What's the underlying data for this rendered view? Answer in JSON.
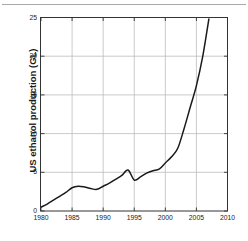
{
  "figure": {
    "name": "us-ethanol-production-chart",
    "background_color": "#ffffff",
    "frame_color": "#333333",
    "grid_color": "#bdbdbd",
    "line_color": "#1a1a1a",
    "top_rule_color": "#a8a8a8"
  },
  "chart_data": {
    "type": "line",
    "title": "",
    "subtitle": "",
    "xlabel": "",
    "ylabel": "US ethanol production (GL)",
    "xlim": [
      1980,
      2010
    ],
    "ylim": [
      0,
      25
    ],
    "xticks": [
      1980,
      1985,
      1990,
      1995,
      2000,
      2005,
      2010
    ],
    "xtick_labels": [
      "1980",
      "1985",
      "1990",
      "1995",
      "2000",
      "2005",
      "2010"
    ],
    "yticks": [
      0,
      5,
      10,
      15,
      20,
      25
    ],
    "ytick_labels": [
      "0",
      "5",
      "10",
      "15",
      "20",
      "25"
    ],
    "grid": true,
    "grid_axes": "both",
    "legend": false,
    "legend_position": "none",
    "series": [
      {
        "name": "US ethanol production",
        "color": "#1a1a1a",
        "x": [
          1980,
          1981,
          1982,
          1983,
          1984,
          1985,
          1986,
          1987,
          1988,
          1989,
          1990,
          1991,
          1992,
          1993,
          1994,
          1995,
          1996,
          1997,
          1998,
          1999,
          2000,
          2001,
          2002,
          2003,
          2004,
          2005,
          2006,
          2007
        ],
        "y": [
          0.5,
          0.9,
          1.4,
          1.9,
          2.4,
          3.0,
          3.2,
          3.1,
          2.9,
          2.8,
          3.2,
          3.6,
          4.1,
          4.6,
          5.3,
          4.0,
          4.4,
          4.9,
          5.2,
          5.4,
          6.2,
          7.0,
          8.1,
          10.6,
          13.4,
          16.2,
          19.9,
          24.8
        ]
      }
    ]
  }
}
